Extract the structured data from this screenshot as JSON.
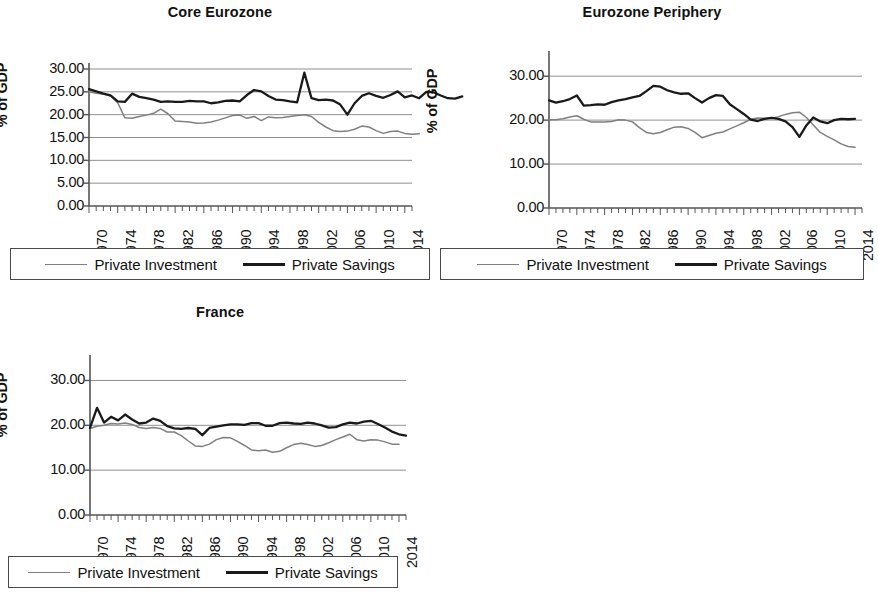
{
  "figure": {
    "panels": [
      "core",
      "periphery",
      "france"
    ],
    "legend": {
      "investment_label": "Private Investment",
      "savings_label": "Private Savings",
      "investment_color": "#808080",
      "savings_color": "#1a1a1a"
    }
  },
  "chart_data": [
    {
      "id": "core",
      "type": "line",
      "title": "Core Eurozone",
      "xlabel": "",
      "ylabel": "% of GDP",
      "xlim": [
        1970,
        2015
      ],
      "ylim": [
        0,
        30
      ],
      "ytick_labels": [
        "30.00",
        "25.00",
        "20.00",
        "15.00",
        "10.00",
        "5.00",
        "0.00"
      ],
      "ytick_values": [
        30,
        25,
        20,
        15,
        10,
        5,
        0
      ],
      "xtick_labels": [
        "1970",
        "1974",
        "1978",
        "1982",
        "1986",
        "1990",
        "1994",
        "1998",
        "2002",
        "2006",
        "2010",
        "2014"
      ],
      "xtick_values": [
        1970,
        1974,
        1978,
        1982,
        1986,
        1990,
        1994,
        1998,
        2002,
        2006,
        2010,
        2014
      ],
      "grid": "horizontal",
      "minor_xticks": "annual",
      "legend_position": "below",
      "x": [
        1970,
        1971,
        1972,
        1973,
        1974,
        1975,
        1976,
        1977,
        1978,
        1979,
        1980,
        1981,
        1982,
        1983,
        1984,
        1985,
        1986,
        1987,
        1988,
        1989,
        1990,
        1991,
        1992,
        1993,
        1994,
        1995,
        1996,
        1997,
        1998,
        1999,
        2000,
        2001,
        2002,
        2003,
        2004,
        2005,
        2006,
        2007,
        2008,
        2009,
        2010,
        2011,
        2012,
        2013,
        2014,
        2015
      ],
      "series": [
        {
          "name": "Private Savings",
          "color": "#1a1a1a",
          "values": [
            25.6,
            25.1,
            24.6,
            24.2,
            22.9,
            22.8,
            24.6,
            23.9,
            23.6,
            23.3,
            22.8,
            22.9,
            22.8,
            22.8,
            23.0,
            22.9,
            22.9,
            22.5,
            22.7,
            23.0,
            23.1,
            22.9,
            24.3,
            25.4,
            25.1,
            24.1,
            23.3,
            23.2,
            22.9,
            22.7,
            29.2,
            23.6,
            23.2,
            23.3,
            23.1,
            22.2,
            20.0,
            22.5,
            24.1,
            24.7,
            24.1,
            23.7,
            24.3,
            25.1,
            23.8,
            24.2,
            23.6,
            25.0,
            24.9,
            24.2,
            23.6,
            23.5,
            24.0
          ]
        },
        {
          "name": "Private Investment",
          "color": "#808080",
          "values": [
            25.0,
            24.7,
            24.5,
            24.1,
            22.6,
            19.3,
            19.2,
            19.6,
            19.9,
            20.3,
            21.2,
            20.2,
            18.6,
            18.5,
            18.4,
            18.1,
            18.2,
            18.4,
            18.8,
            19.3,
            19.8,
            19.9,
            19.2,
            19.6,
            18.7,
            19.5,
            19.3,
            19.4,
            19.6,
            19.8,
            20.0,
            19.6,
            18.3,
            17.3,
            16.5,
            16.3,
            16.4,
            16.8,
            17.5,
            17.3,
            16.5,
            15.9,
            16.3,
            16.4,
            15.9,
            15.7,
            15.8
          ]
        }
      ]
    },
    {
      "id": "periphery",
      "type": "line",
      "title": "Eurozone Periphery",
      "xlabel": "",
      "ylabel": "% of GDP",
      "xlim": [
        1970,
        2015
      ],
      "ylim": [
        0,
        33
      ],
      "ytick_labels": [
        "30.00",
        "20.00",
        "10.00",
        "0.00"
      ],
      "ytick_values": [
        30,
        20,
        10,
        0
      ],
      "xtick_labels": [
        "1970",
        "1974",
        "1978",
        "1982",
        "1986",
        "1990",
        "1994",
        "1998",
        "2002",
        "2006",
        "2010",
        "2014"
      ],
      "xtick_values": [
        1970,
        1974,
        1978,
        1982,
        1986,
        1990,
        1994,
        1998,
        2002,
        2006,
        2010,
        2014
      ],
      "grid": "horizontal",
      "minor_xticks": "annual",
      "legend_position": "below",
      "x": [
        1970,
        1971,
        1972,
        1973,
        1974,
        1975,
        1976,
        1977,
        1978,
        1979,
        1980,
        1981,
        1982,
        1983,
        1984,
        1985,
        1986,
        1987,
        1988,
        1989,
        1990,
        1991,
        1992,
        1993,
        1994,
        1995,
        1996,
        1997,
        1998,
        1999,
        2000,
        2001,
        2002,
        2003,
        2004,
        2005,
        2006,
        2007,
        2008,
        2009,
        2010,
        2011,
        2012,
        2013,
        2014
      ],
      "series": [
        {
          "name": "Private Savings",
          "color": "#1a1a1a",
          "values": [
            24.5,
            24.0,
            24.3,
            24.8,
            25.6,
            23.3,
            23.4,
            23.6,
            23.5,
            24.1,
            24.5,
            24.8,
            25.2,
            25.5,
            26.6,
            27.8,
            27.6,
            26.8,
            26.3,
            26.0,
            26.1,
            25.0,
            24.0,
            25.0,
            25.7,
            25.5,
            23.6,
            22.5,
            21.4,
            20.1,
            19.8,
            20.3,
            20.5,
            20.3,
            19.7,
            18.4,
            16.2,
            18.8,
            20.6,
            19.7,
            19.3,
            20.0,
            20.3,
            20.2,
            20.3
          ]
        },
        {
          "name": "Private Investment",
          "color": "#808080",
          "values": [
            20.1,
            20.1,
            20.3,
            20.7,
            21.0,
            20.2,
            19.6,
            19.6,
            19.6,
            19.7,
            20.1,
            20.0,
            19.6,
            18.3,
            17.2,
            16.9,
            17.2,
            17.8,
            18.4,
            18.5,
            18.1,
            17.2,
            16.0,
            16.5,
            17.0,
            17.3,
            18.0,
            18.7,
            19.4,
            20.2,
            20.5,
            20.4,
            20.4,
            20.8,
            21.3,
            21.7,
            21.8,
            20.6,
            18.9,
            17.2,
            16.3,
            15.5,
            14.6,
            14.0,
            13.8
          ]
        }
      ]
    },
    {
      "id": "france",
      "type": "line",
      "title": "France",
      "xlabel": "",
      "ylabel": "% of GDP",
      "xlim": [
        1970,
        2015
      ],
      "ylim": [
        0,
        33
      ],
      "ytick_labels": [
        "30.00",
        "20.00",
        "10.00",
        "0.00"
      ],
      "ytick_values": [
        30,
        20,
        10,
        0
      ],
      "xtick_labels": [
        "1970",
        "1974",
        "1978",
        "1982",
        "1986",
        "1990",
        "1994",
        "1998",
        "2002",
        "2006",
        "2010",
        "2014"
      ],
      "xtick_values": [
        1970,
        1974,
        1978,
        1982,
        1986,
        1990,
        1994,
        1998,
        2002,
        2006,
        2010,
        2014
      ],
      "grid": "horizontal",
      "minor_xticks": "annual",
      "legend_position": "below",
      "x": [
        1970,
        1971,
        1972,
        1973,
        1974,
        1975,
        1976,
        1977,
        1978,
        1979,
        1980,
        1981,
        1982,
        1983,
        1984,
        1985,
        1986,
        1987,
        1988,
        1989,
        1990,
        1991,
        1992,
        1993,
        1994,
        1995,
        1996,
        1997,
        1998,
        1999,
        2000,
        2001,
        2002,
        2003,
        2004,
        2005,
        2006,
        2007,
        2008,
        2009,
        2010,
        2011,
        2012,
        2013,
        2014
      ],
      "series": [
        {
          "name": "Private Savings",
          "color": "#1a1a1a",
          "values": [
            19.4,
            23.9,
            20.6,
            21.9,
            21.1,
            22.4,
            21.3,
            20.4,
            20.6,
            21.5,
            21.0,
            19.8,
            19.3,
            19.2,
            19.4,
            19.2,
            17.8,
            19.4,
            19.7,
            20.0,
            20.2,
            20.2,
            20.1,
            20.5,
            20.5,
            19.9,
            19.9,
            20.5,
            20.6,
            20.4,
            20.3,
            20.6,
            20.4,
            20.0,
            19.5,
            19.6,
            20.2,
            20.6,
            20.4,
            20.8,
            21.0,
            20.3,
            19.5,
            18.6,
            18.0,
            17.7
          ]
        },
        {
          "name": "Private Investment",
          "color": "#808080",
          "values": [
            19.3,
            19.8,
            20.0,
            20.4,
            20.3,
            20.5,
            20.2,
            19.5,
            19.3,
            19.5,
            19.3,
            18.5,
            18.5,
            17.7,
            16.5,
            15.4,
            15.3,
            15.8,
            16.8,
            17.3,
            17.2,
            16.4,
            15.5,
            14.5,
            14.3,
            14.5,
            14.0,
            14.2,
            15.0,
            15.7,
            16.0,
            15.7,
            15.3,
            15.5,
            16.1,
            16.8,
            17.4,
            18.0,
            16.8,
            16.5,
            16.8,
            16.7,
            16.3,
            15.8,
            15.8
          ]
        }
      ]
    }
  ]
}
